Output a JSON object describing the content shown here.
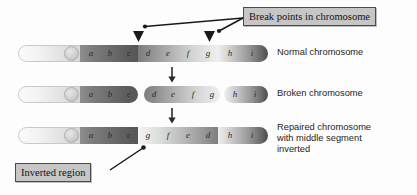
{
  "figure": {
    "background": "#ffffff"
  },
  "callouts": {
    "break_points": {
      "label": "Break points in chromosome",
      "box_fill": "#c6c6c6",
      "box_border": "#4a4a4a"
    },
    "inverted_region": {
      "label": "Inverted region",
      "box_fill": "#c6c6c6",
      "box_border": "#4a4a4a"
    }
  },
  "captions": {
    "normal": "Normal chromosome",
    "broken": "Broken chromosome",
    "repaired_line1": "Repaired chromosome",
    "repaired_line2": "with middle segment",
    "repaired_line3": "inverted"
  },
  "chromosomes": {
    "normal": {
      "name": "normal-chromosome",
      "genes": [
        "a",
        "b",
        "c",
        "d",
        "e",
        "f",
        "g",
        "h",
        "i"
      ],
      "fragment_count": 1
    },
    "broken": {
      "name": "broken-chromosome",
      "genes": [
        "a",
        "b",
        "c",
        "d",
        "e",
        "f",
        "g",
        "h",
        "i"
      ],
      "fragment_count": 3,
      "fragments": [
        {
          "genes": [
            "a",
            "b",
            "c"
          ]
        },
        {
          "genes": [
            "d",
            "e",
            "f",
            "g"
          ]
        },
        {
          "genes": [
            "h",
            "i"
          ]
        }
      ]
    },
    "repaired": {
      "name": "repaired-chromosome",
      "genes": [
        "a",
        "b",
        "c",
        "g",
        "f",
        "e",
        "d",
        "h",
        "i"
      ],
      "fragment_count": 1,
      "inverted_genes": [
        "g",
        "f",
        "e",
        "d"
      ]
    }
  },
  "markers": {
    "break_arrow_count": 2,
    "flow_arrow_count": 2
  }
}
